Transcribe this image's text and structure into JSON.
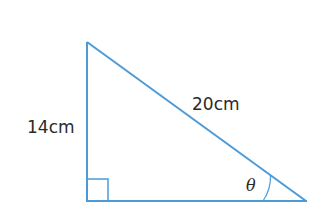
{
  "diagram": {
    "type": "right-triangle",
    "line_color": "#4b9bd9",
    "text_color": "#2a2a2a",
    "vertices": {
      "top": [
        87,
        42
      ],
      "right_angle": [
        87,
        201
      ],
      "acute": [
        306,
        201
      ]
    },
    "labels": {
      "vertical_side": "14cm",
      "hypotenuse": "20cm",
      "angle": "θ"
    },
    "right_angle_marker": true
  }
}
